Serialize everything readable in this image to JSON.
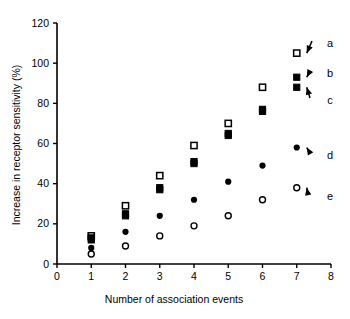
{
  "chart_data": {
    "type": "scatter",
    "title": "",
    "xlabel": "Number of association events",
    "ylabel": "Increase in receptor sensitivity (%)",
    "xlim": [
      0,
      8
    ],
    "ylim": [
      0,
      120
    ],
    "xticks": [
      0,
      1,
      2,
      3,
      4,
      5,
      6,
      7,
      8
    ],
    "yticks": [
      0,
      20,
      40,
      60,
      80,
      100,
      120
    ],
    "xtick_labels": [
      "0",
      "1",
      "2",
      "3",
      "4",
      "5",
      "6",
      "7",
      "8"
    ],
    "ytick_labels": [
      "0",
      "20",
      "40",
      "60",
      "80",
      "100",
      "120"
    ],
    "grid": false,
    "legend_position": "right-annotations",
    "x": [
      1,
      2,
      3,
      4,
      5,
      6,
      7
    ],
    "series": [
      {
        "name": "a",
        "label": "a",
        "marker": "open-square",
        "color": "#000000",
        "values": [
          14,
          29,
          44,
          59,
          70,
          88,
          105
        ]
      },
      {
        "name": "b",
        "label": "b",
        "marker": "filled-square",
        "color": "#000000",
        "values": [
          13,
          25,
          38,
          51,
          65,
          77,
          93
        ]
      },
      {
        "name": "c",
        "label": "c",
        "marker": "filled-square-lower",
        "color": "#000000",
        "values": [
          12,
          24,
          37,
          50,
          64,
          76,
          88
        ]
      },
      {
        "name": "d",
        "label": "d",
        "marker": "filled-circle",
        "color": "#000000",
        "values": [
          8,
          16,
          24,
          32,
          41,
          49,
          58
        ]
      },
      {
        "name": "e",
        "label": "e",
        "marker": "open-circle",
        "color": "#000000",
        "values": [
          5,
          9,
          14,
          19,
          24,
          32,
          38
        ]
      }
    ],
    "annotations": [
      {
        "label": "a",
        "points_to_series": "a",
        "points_to_x": 7,
        "points_to_y": 105
      },
      {
        "label": "b",
        "points_to_series": "b",
        "points_to_x": 7,
        "points_to_y": 93
      },
      {
        "label": "c",
        "points_to_series": "c",
        "points_to_x": 7,
        "points_to_y": 88
      },
      {
        "label": "d",
        "points_to_series": "d",
        "points_to_x": 7,
        "points_to_y": 58
      },
      {
        "label": "e",
        "points_to_series": "e",
        "points_to_x": 7,
        "points_to_y": 38
      }
    ]
  }
}
